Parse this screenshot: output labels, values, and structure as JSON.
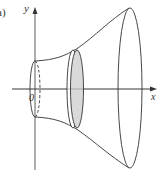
{
  "figure": {
    "part_label": "a)",
    "axes": {
      "x_label": "x",
      "y_label": "y",
      "origin_label": "0"
    },
    "colors": {
      "stroke": "#333333",
      "disc_fill": "#d9d9d9",
      "background": "#ffffff"
    }
  }
}
